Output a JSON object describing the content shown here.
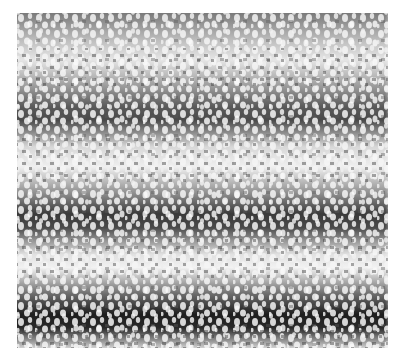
{
  "image": {
    "description": "Grayscale photograph of a pebbled/perforated texture with alternating light and dark horizontal wavy bands",
    "colors": {
      "background": "#ffffff",
      "dark_band": "#1e1e1e",
      "mid_band": "#7a7a7a",
      "light_band": "#f2f2f2",
      "spot": "#f5f5f5"
    }
  }
}
